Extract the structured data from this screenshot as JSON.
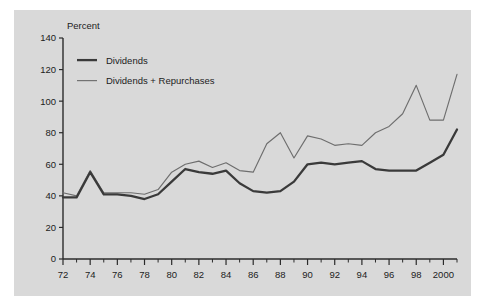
{
  "chart_data": {
    "type": "line",
    "title": "",
    "subtitle": "",
    "xlabel": "",
    "ylabel": "Percent",
    "ylim": [
      0,
      140
    ],
    "xlim": [
      1972,
      2001
    ],
    "ytick_labels": [
      "0",
      "20",
      "40",
      "60",
      "80",
      "100",
      "120",
      "140"
    ],
    "ytick_values": [
      0,
      20,
      40,
      60,
      80,
      100,
      120,
      140
    ],
    "xtick_labels": [
      "72",
      "74",
      "76",
      "78",
      "80",
      "82",
      "84",
      "86",
      "88",
      "90",
      "92",
      "94",
      "96",
      "98",
      "2000"
    ],
    "xtick_values": [
      1972,
      1974,
      1976,
      1978,
      1980,
      1982,
      1984,
      1986,
      1988,
      1990,
      1992,
      1994,
      1996,
      1998,
      2000
    ],
    "grid": false,
    "legend_position": "top-left",
    "x": [
      1972,
      1973,
      1974,
      1975,
      1976,
      1977,
      1978,
      1979,
      1980,
      1981,
      1982,
      1983,
      1984,
      1985,
      1986,
      1987,
      1988,
      1989,
      1990,
      1991,
      1992,
      1993,
      1994,
      1995,
      1996,
      1997,
      1998,
      1999,
      2000,
      2001
    ],
    "series": [
      {
        "name": "Dividends",
        "color": "#3a3a3a",
        "values": [
          39,
          39,
          55,
          41,
          41,
          40,
          38,
          41,
          49,
          57,
          55,
          54,
          56,
          48,
          43,
          42,
          43,
          49,
          60,
          61,
          60,
          61,
          62,
          57,
          56,
          56,
          56,
          61,
          66,
          82
        ]
      },
      {
        "name": "Dividends + Repurchases",
        "color": "#6e6e6e",
        "values": [
          42,
          40,
          56,
          42,
          42,
          42,
          41,
          44,
          55,
          60,
          62,
          58,
          61,
          56,
          55,
          73,
          80,
          64,
          78,
          76,
          72,
          73,
          72,
          80,
          84,
          92,
          110,
          88,
          88,
          117
        ]
      }
    ],
    "legend": [
      {
        "label": "Dividends",
        "color": "#3a3a3a",
        "style": "thick"
      },
      {
        "label": "Dividends + Repurchases",
        "color": "#6e6e6e",
        "style": "thin"
      }
    ],
    "colors": {
      "panel_background": "#d9d9d9",
      "page_background": "#ffffff",
      "axis": "#2b2b2b",
      "text": "#1c1c1c"
    }
  }
}
